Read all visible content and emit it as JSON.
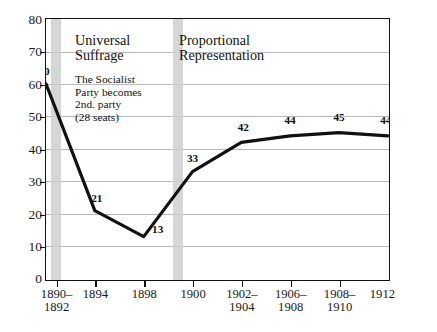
{
  "chart_data": {
    "type": "line",
    "title": "",
    "xlabel": "",
    "ylabel": "",
    "ylim": [
      0,
      80
    ],
    "ytick_values": [
      80,
      70,
      60,
      50,
      40,
      30,
      20,
      10,
      0
    ],
    "grid": true,
    "legend": "none",
    "categories": [
      "1890–\n1892",
      "1894",
      "1898",
      "1900",
      "1902–\n1904",
      "1906–\n1908",
      "1908–\n1910",
      "1912"
    ],
    "values": [
      60,
      21,
      13,
      33,
      42,
      44,
      45,
      44
    ],
    "point_labels": [
      "60",
      "21",
      "13",
      "33",
      "42",
      "44",
      "45",
      "44"
    ],
    "series": [
      {
        "name": "seats",
        "values": [
          60,
          21,
          13,
          33,
          42,
          44,
          45,
          44
        ]
      }
    ],
    "annotations": [
      {
        "name": "universal-suffrage",
        "title": "Universal\nSuffrage",
        "body": "The Socialist\nParty becomes\n2nd. party\n(28 seats)"
      },
      {
        "name": "proportional-representation",
        "title": "Proportional\nRepresentation",
        "body": ""
      }
    ],
    "event_bands": [
      {
        "name": "universal-suffrage-band",
        "category": "1890–1892"
      },
      {
        "name": "proportional-representation-band",
        "category": "1898"
      }
    ],
    "colors": {
      "line": "#111111",
      "grid": "#b9b9b9",
      "band": "#cfcfcf",
      "axis": "#111111",
      "text": "#1a1a1a"
    }
  }
}
